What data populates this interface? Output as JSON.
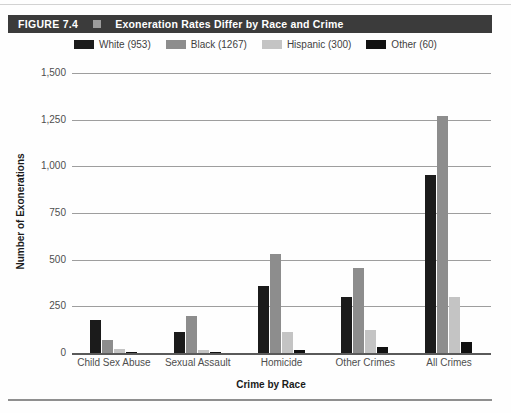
{
  "chart_data": {
    "type": "bar",
    "figure_label": "FIGURE 7.4",
    "title": "Exoneration Rates Differ by Race and Crime",
    "categories": [
      "Child Sex Abuse",
      "Sexual Assault",
      "Homicide",
      "Other Crimes",
      "All Crimes"
    ],
    "series": [
      {
        "name": "White (953)",
        "color": "#1b1b1b",
        "values": [
          175,
          110,
          360,
          300,
          953
        ]
      },
      {
        "name": "Black (1267)",
        "color": "#8d8d8d",
        "values": [
          70,
          200,
          530,
          455,
          1267
        ]
      },
      {
        "name": "Hispanic (300)",
        "color": "#c4c4c4",
        "values": [
          20,
          15,
          115,
          125,
          300
        ]
      },
      {
        "name": "Other (60)",
        "color": "#111111",
        "values": [
          5,
          5,
          15,
          30,
          60
        ]
      }
    ],
    "xlabel": "Crime by Race",
    "ylabel": "Number of Exonerations",
    "ylim": [
      0,
      1500
    ],
    "ytick_interval": 250,
    "ytick_labels": [
      "0",
      "250",
      "500",
      "750",
      "1,000",
      "1,250",
      "1,500"
    ],
    "grid": true,
    "legend_position": "top"
  }
}
